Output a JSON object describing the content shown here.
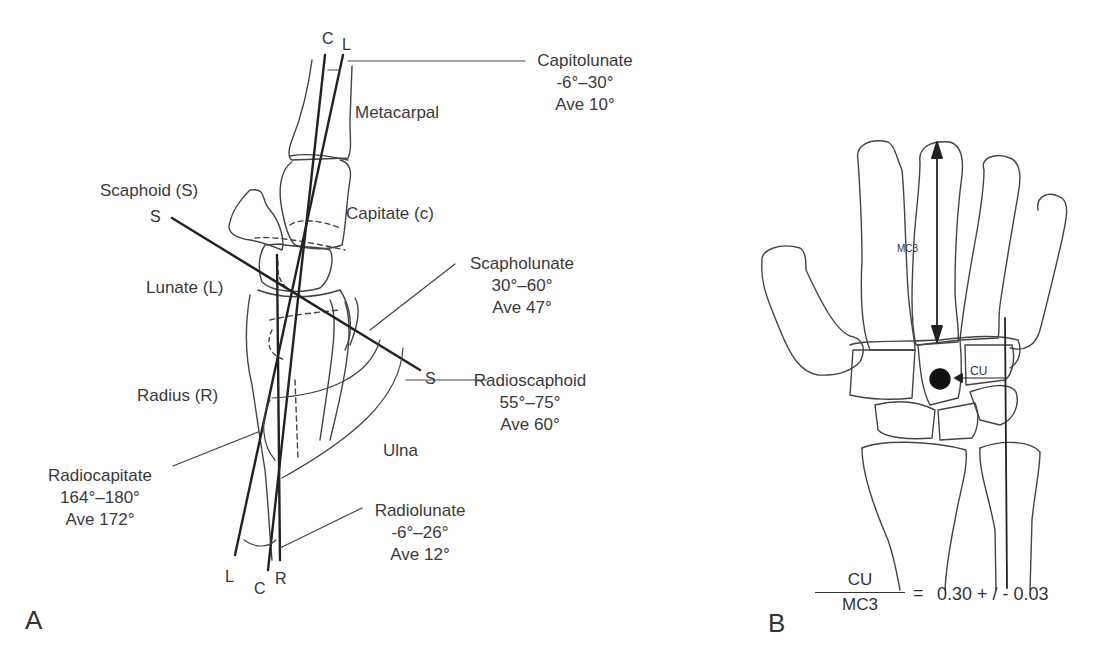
{
  "panel_a": {
    "panel_label": "A",
    "axis_labels": {
      "top_c": "C",
      "top_l": "L",
      "scaphoid_top": "S",
      "scaphoid_bottom": "S",
      "bottom_l": "L",
      "bottom_c": "C",
      "bottom_r": "R"
    },
    "bones": {
      "metacarpal": "Metacarpal",
      "scaphoid": "Scaphoid (S)",
      "capitate": "Capitate (c)",
      "lunate": "Lunate (L)",
      "radius": "Radius (R)",
      "ulna": "Ulna"
    },
    "angles": [
      {
        "name": "Capitolunate",
        "range": "-6°–30°",
        "average": "Ave 10°"
      },
      {
        "name": "Scapholunate",
        "range": "30°–60°",
        "average": "Ave 47°"
      },
      {
        "name": "Radioscaphoid",
        "range": "55°–75°",
        "average": "Ave 60°"
      },
      {
        "name": "Radiocapitate",
        "range": "164°–180°",
        "average": "Ave 172°"
      },
      {
        "name": "Radiolunate",
        "range": "-6°–26°",
        "average": "Ave 12°"
      }
    ]
  },
  "panel_b": {
    "panel_label": "B",
    "mc3_label": "MC3",
    "cu_label": "CU",
    "formula": {
      "numerator": "CU",
      "denominator": "MC3",
      "equals": "=",
      "value": "0.30 + / - 0.03"
    }
  }
}
